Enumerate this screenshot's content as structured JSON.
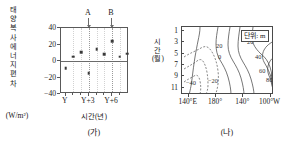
{
  "figure": {
    "panels": [
      {
        "caption": "(가)",
        "y_axis_label_lines": [
          "태",
          "양",
          "복",
          "사",
          "에",
          "너",
          "지",
          "편",
          "차"
        ],
        "y_axis_unit": "(W/m²)",
        "x_axis_title": "시간(년)",
        "markers": [
          {
            "label": "A",
            "x": 3
          },
          {
            "label": "B",
            "x": 6
          }
        ]
      },
      {
        "caption": "(나)",
        "y_axis_label_lines": [
          "시",
          "간",
          "(월)"
        ],
        "unit_note": "단위: m"
      }
    ]
  },
  "chart_data": [
    {
      "type": "scatter",
      "title": "(가)",
      "xlabel": "시간(년)",
      "ylabel": "태양 복사 에너지 편차 (W/m²)",
      "xlim": [
        -0.6,
        8.2
      ],
      "ylim": [
        -40,
        40
      ],
      "ytick_values": [
        40,
        20,
        0,
        -20,
        -40
      ],
      "ytick_labels": [
        "40",
        "20",
        "0",
        "−20",
        "−40"
      ],
      "xtick_values": [
        0,
        3,
        6
      ],
      "xtick_labels": [
        "Y",
        "Y+3",
        "Y+6"
      ],
      "xtick_minor_values": [
        1,
        2,
        4,
        5,
        7
      ],
      "grid": "vertical-dotted",
      "zero_line": true,
      "annotations": [
        {
          "label": "A",
          "x": 3,
          "type": "down-arrow-above-axis"
        },
        {
          "label": "B",
          "x": 6,
          "type": "down-arrow-above-axis"
        }
      ],
      "points": [
        {
          "x": 0.0,
          "y": -9
        },
        {
          "x": 1.0,
          "y": 5
        },
        {
          "x": 2.0,
          "y": 11
        },
        {
          "x": 3.0,
          "y": -15
        },
        {
          "x": 4.0,
          "y": 14
        },
        {
          "x": 5.0,
          "y": 8
        },
        {
          "x": 6.0,
          "y": 24
        },
        {
          "x": 7.0,
          "y": 5
        },
        {
          "x": 8.0,
          "y": 9
        }
      ]
    },
    {
      "type": "contour",
      "title": "(나)",
      "unit": "단위: m",
      "xlabel": "",
      "ylabel": "시간(월)",
      "xtick_values": [
        140,
        180,
        220,
        260
      ],
      "xtick_labels": [
        "140°E",
        "180°",
        "140°",
        "100°W"
      ],
      "ytick_values": [
        1,
        3,
        5,
        7,
        9,
        11
      ],
      "ytick_labels": [
        "1",
        "3",
        "5",
        "7",
        "9",
        "11"
      ],
      "ylim": [
        1,
        12
      ],
      "contour_levels": [
        -40,
        -20,
        0,
        20,
        40,
        60,
        80
      ],
      "negative_contours_dashed": true,
      "contour_labels": [
        "−40",
        "−20",
        "0",
        "20",
        "20",
        "40",
        "60",
        "80"
      ]
    }
  ]
}
